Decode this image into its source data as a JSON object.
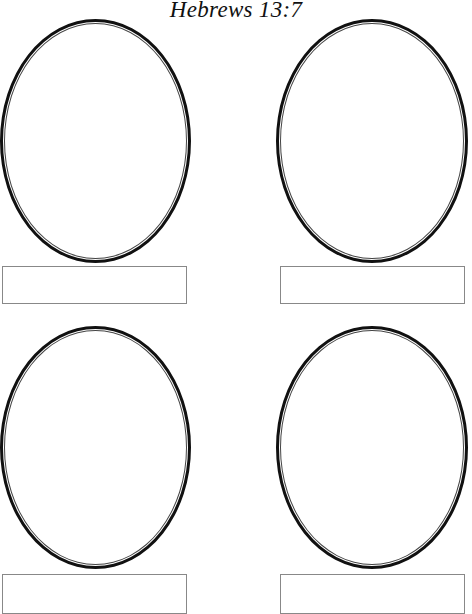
{
  "page": {
    "title": "Hebrews 13:7",
    "background": "#ffffff",
    "line_color": "#111111"
  },
  "frames": [
    {
      "position": "top-left",
      "oval": {
        "x": 0,
        "y": 19,
        "w": 191,
        "h": 244
      },
      "label_box": {
        "x": 2,
        "y": 266,
        "w": 185,
        "h": 38
      },
      "label": ""
    },
    {
      "position": "top-right",
      "oval": {
        "x": 276,
        "y": 19,
        "w": 192,
        "h": 244
      },
      "label_box": {
        "x": 280,
        "y": 266,
        "w": 185,
        "h": 38
      },
      "label": ""
    },
    {
      "position": "bottom-left",
      "oval": {
        "x": 0,
        "y": 326,
        "w": 191,
        "h": 243
      },
      "label_box": {
        "x": 2,
        "y": 574,
        "w": 185,
        "h": 40
      },
      "label": ""
    },
    {
      "position": "bottom-right",
      "oval": {
        "x": 276,
        "y": 326,
        "w": 192,
        "h": 243
      },
      "label_box": {
        "x": 280,
        "y": 574,
        "w": 185,
        "h": 40
      },
      "label": ""
    }
  ]
}
